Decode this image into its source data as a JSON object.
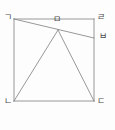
{
  "figure": {
    "kind": "geometry-diagram",
    "canvas": {
      "width": 115,
      "height": 130
    },
    "style": {
      "background_color": "#fdfdfd",
      "stroke_color": "#8c8c8c",
      "label_color": "#4a4a4a",
      "stroke_width": 0.9
    },
    "labels": {
      "top_left": "ㄱ",
      "top_right": "ㄹ",
      "bottom_left": "ㄴ",
      "bottom_right": "ㄷ",
      "apex": "ㅁ",
      "right_edge": "ㅂ"
    },
    "points": {
      "top_left": {
        "x": 14,
        "y": 19
      },
      "top_right": {
        "x": 94,
        "y": 19
      },
      "bottom_left": {
        "x": 14,
        "y": 101
      },
      "bottom_right": {
        "x": 94,
        "y": 101
      },
      "apex": {
        "x": 58,
        "y": 30
      },
      "right_edge": {
        "x": 94,
        "y": 38
      }
    },
    "segments": [
      {
        "name": "square-top",
        "from": "top_left",
        "to": "top_right"
      },
      {
        "name": "square-right",
        "from": "top_right",
        "to": "bottom_right"
      },
      {
        "name": "square-bottom",
        "from": "bottom_right",
        "to": "bottom_left"
      },
      {
        "name": "square-left",
        "from": "bottom_left",
        "to": "top_left"
      },
      {
        "name": "transversal-ga-to-ba",
        "from": "top_left",
        "to": "right_edge"
      },
      {
        "name": "triangle-ma-to-na",
        "from": "apex",
        "to": "bottom_left"
      },
      {
        "name": "triangle-ma-to-da",
        "from": "apex",
        "to": "bottom_right"
      }
    ]
  }
}
